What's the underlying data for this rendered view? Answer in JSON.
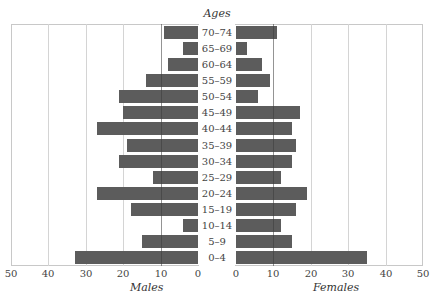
{
  "chart_data": {
    "type": "bar",
    "subtype": "population-pyramid",
    "title": "Ages",
    "categories": [
      "70–74",
      "65–69",
      "60–64",
      "55–59",
      "50–54",
      "45–49",
      "40–44",
      "35–39",
      "30–34",
      "25–29",
      "20–24",
      "15–19",
      "10–14",
      "5–9",
      "0–4"
    ],
    "series": [
      {
        "name": "Males",
        "values": [
          9,
          4,
          8,
          14,
          21,
          20,
          27,
          19,
          21,
          12,
          27,
          18,
          4,
          15,
          33
        ]
      },
      {
        "name": "Females",
        "values": [
          11,
          3,
          7,
          9,
          6,
          17,
          15,
          16,
          15,
          12,
          19,
          16,
          12,
          15,
          35
        ]
      }
    ],
    "xlabel_left": "Males",
    "xlabel_right": "Females",
    "ylabel": "Ages",
    "xlim": [
      0,
      50
    ],
    "xticks_left": [
      "50",
      "40",
      "30",
      "20",
      "10",
      "0"
    ],
    "xticks_right": [
      "0",
      "10",
      "20",
      "30",
      "40",
      "50"
    ],
    "grid": true,
    "bar_color": "#5c5c5c",
    "orientation": "horizontal"
  },
  "labels": {
    "title": "Ages",
    "males": "Males",
    "females": "Females"
  }
}
